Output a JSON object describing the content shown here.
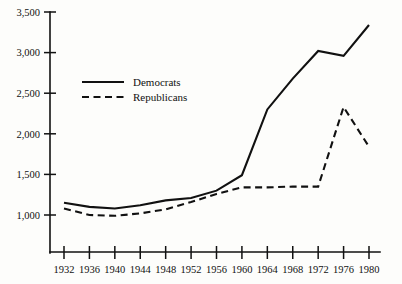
{
  "chart_data": {
    "type": "line",
    "title": "",
    "subtitle": "",
    "xlabel": "",
    "ylabel": "",
    "x": [
      1932,
      1936,
      1940,
      1944,
      1948,
      1952,
      1956,
      1960,
      1964,
      1968,
      1972,
      1976,
      1980
    ],
    "xtick_labels": [
      "1932",
      "1936",
      "1940",
      "1944",
      "1948",
      "1952",
      "1956",
      "1960",
      "1964",
      "1968",
      "1972",
      "1976",
      "1980"
    ],
    "ytick_labels": [
      "1,000",
      "1,500",
      "2,000",
      "2,500",
      "3,000",
      "3,500"
    ],
    "ytick_values": [
      1000,
      1500,
      2000,
      2500,
      3000,
      3500
    ],
    "xlim": [
      1932,
      1980
    ],
    "ylim": [
      800,
      3500
    ],
    "grid": false,
    "legend_position": "upper-left-inside",
    "series": [
      {
        "name": "Democrats",
        "style": "solid",
        "color": "#111111",
        "values": [
          1150,
          1100,
          1080,
          1120,
          1180,
          1210,
          1300,
          1490,
          2300,
          2680,
          3020,
          2960,
          3340
        ]
      },
      {
        "name": "Republicans",
        "style": "dashed",
        "color": "#111111",
        "values": [
          1080,
          1000,
          990,
          1020,
          1070,
          1160,
          1260,
          1340,
          1340,
          1350,
          1350,
          2330,
          1840
        ]
      }
    ]
  },
  "legend": {
    "items": [
      {
        "label": "Democrats",
        "style": "solid"
      },
      {
        "label": "Republicans",
        "style": "dashed"
      }
    ]
  }
}
